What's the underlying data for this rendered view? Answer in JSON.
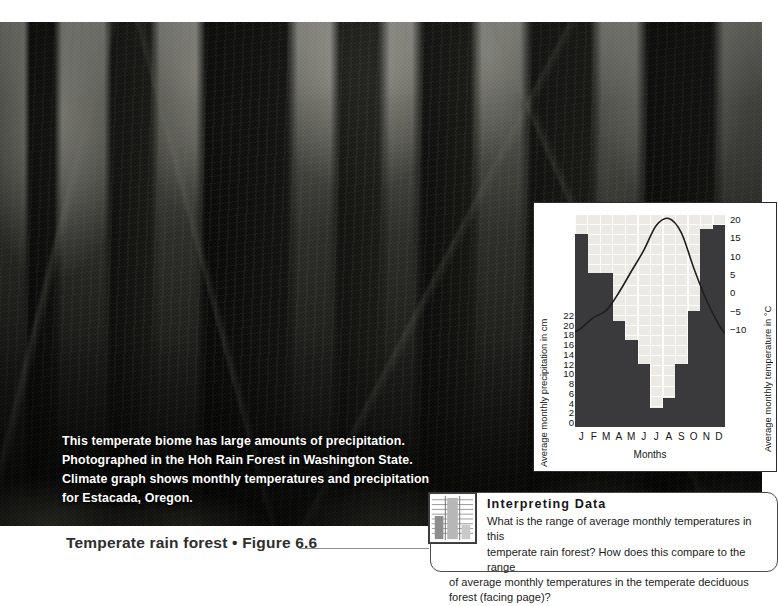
{
  "photo": {
    "alt_name": "temperate-rain-forest-photograph",
    "caption_lines": [
      "This temperate biome has large amounts of precipitation.",
      "Photographed in the Hoh Rain Forest in Washington State.",
      "Climate graph shows monthly temperatures and precipitation",
      "for Estacada, Oregon."
    ]
  },
  "figure": {
    "title": "Temperate rain forest  •  Figure 6.6"
  },
  "interpreting": {
    "heading": "Interpreting Data",
    "icon": "bar-chart-table-icon",
    "body_lines": [
      "What is the range of average monthly temperatures in this",
      "temperate rain forest? How does this compare to the range",
      "of average monthly temperatures in the temperate deciduous",
      "forest (facing page)?"
    ]
  },
  "chart": {
    "left_axis_title": "Average monthly precipitation in cm",
    "right_axis_title": "Average monthly temperature in °C",
    "x_axis_title": "Months"
  },
  "chart_data": {
    "type": "bar",
    "title": "",
    "subtitle": "",
    "categories": [
      "J",
      "F",
      "M",
      "A",
      "M",
      "J",
      "J",
      "A",
      "S",
      "O",
      "N",
      "D"
    ],
    "series": [
      {
        "name": "Average monthly precipitation in cm",
        "type": "bar",
        "axis": "left",
        "values": [
          20,
          16,
          16,
          11,
          9,
          6.5,
          2,
          3,
          6.5,
          12,
          20.5,
          21
        ],
        "color": "#3a3a3c"
      },
      {
        "name": "Average monthly temperature in °C",
        "type": "line",
        "axis": "right",
        "values": [
          4,
          5.5,
          6.5,
          9,
          12,
          15,
          18.5,
          19.5,
          17.5,
          12.5,
          8,
          4.5
        ],
        "color": "#1e1e1e"
      }
    ],
    "xlabel": "Months",
    "ylabel": "Average monthly precipitation in cm",
    "y2label": "Average monthly temperature in °C",
    "ylim": [
      0,
      22
    ],
    "y2lim": [
      -10,
      20
    ],
    "yticks": [
      22,
      20,
      18,
      16,
      14,
      12,
      10,
      8,
      6,
      4,
      2,
      0
    ],
    "y2ticks": [
      20,
      15,
      10,
      5,
      0,
      -5,
      -10
    ],
    "grid": true,
    "legend": "none",
    "plot_background": "#eceae4"
  }
}
